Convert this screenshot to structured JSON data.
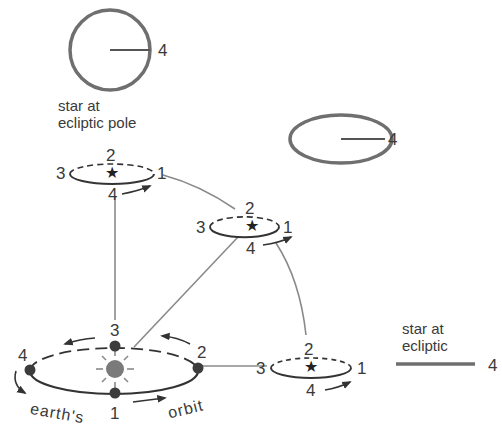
{
  "colors": {
    "ink": "#333333",
    "gray_circle": "#6f6f6f",
    "connector": "#8a8a8a",
    "sun": "#7a7a7a",
    "earth_dot": "#3c3c3c"
  },
  "pole_star": {
    "caption_line1": "star at",
    "caption_line2": "ecliptic pole",
    "label": "4"
  },
  "mid_latitude_star": {
    "label": "4"
  },
  "ecliptic_star": {
    "caption_line1": "star at",
    "caption_line2": "ecliptic",
    "label": "4"
  },
  "parallax_ellipses": [
    {
      "name": "top-left",
      "labels": {
        "p1": "1",
        "p2": "2",
        "p3": "3",
        "p4": "4"
      }
    },
    {
      "name": "middle",
      "labels": {
        "p1": "1",
        "p2": "2",
        "p3": "3",
        "p4": "4"
      }
    },
    {
      "name": "right",
      "labels": {
        "p1": "1",
        "p2": "2",
        "p3": "3",
        "p4": "4"
      }
    }
  ],
  "earth_orbit": {
    "labels": {
      "p1": "1",
      "p2": "2",
      "p3": "3",
      "p4": "4"
    },
    "caption_word1": "earth's",
    "caption_word2": "orbit"
  },
  "icons": {
    "star_glyph": "★"
  }
}
